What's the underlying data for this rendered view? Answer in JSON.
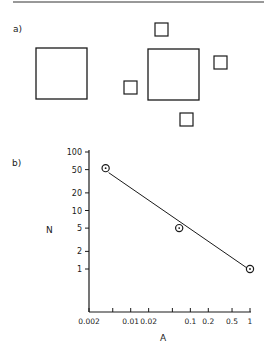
{
  "figure": {
    "panel_a": {
      "label": "a)",
      "large_squares": [
        {
          "x": 36,
          "y": 48,
          "size": 51
        },
        {
          "x": 148,
          "y": 49,
          "size": 51
        }
      ],
      "small_squares": [
        {
          "x": 155,
          "y": 23,
          "size": 13
        },
        {
          "x": 214,
          "y": 56,
          "size": 13
        },
        {
          "x": 124,
          "y": 81,
          "size": 13
        },
        {
          "x": 180,
          "y": 113,
          "size": 13
        }
      ]
    },
    "panel_b": {
      "label": "b)"
    }
  },
  "chart_data": {
    "type": "scatter",
    "title": "",
    "xlabel": "A",
    "ylabel": "N",
    "xscale": "log",
    "yscale": "log",
    "xlim": [
      0.002,
      1
    ],
    "ylim": [
      0.18,
      100
    ],
    "grid": false,
    "legend": null,
    "x_ticks": [
      0.002,
      0.005,
      0.01,
      0.02,
      0.05,
      0.1,
      0.2,
      0.5,
      1
    ],
    "x_tick_labels": [
      "0.002",
      "",
      "0.01",
      "0.02",
      "",
      "0.1",
      "0.2",
      "0.5",
      "1"
    ],
    "y_ticks": [
      100,
      50,
      20,
      10,
      5,
      2,
      1
    ],
    "y_tick_labels": [
      "100",
      "50",
      "20",
      "10",
      "5",
      "2",
      "1"
    ],
    "series": [
      {
        "name": "data",
        "marker": "circled-dot",
        "x": [
          0.0038,
          0.065,
          1
        ],
        "y": [
          53,
          5,
          1
        ]
      },
      {
        "name": "fit",
        "style": "line",
        "x": [
          0.0038,
          1
        ],
        "y": [
          48,
          1
        ]
      }
    ]
  }
}
